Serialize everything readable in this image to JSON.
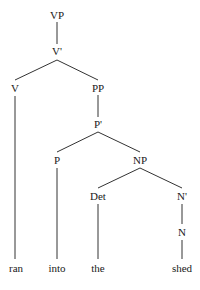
{
  "diagram": {
    "type": "syntax-tree",
    "phrase": "ran into the shed",
    "colors": {
      "text": "#1a1a1a",
      "edge": "#333333",
      "background": "#ffffff"
    },
    "nodes": [
      {
        "id": "vp",
        "label": "VP",
        "x": 57,
        "y": 15
      },
      {
        "id": "vbar",
        "label": "V'",
        "x": 57,
        "y": 51
      },
      {
        "id": "v",
        "label": "V",
        "x": 15,
        "y": 88
      },
      {
        "id": "pp",
        "label": "PP",
        "x": 98,
        "y": 88
      },
      {
        "id": "pbar",
        "label": "P'",
        "x": 98,
        "y": 124
      },
      {
        "id": "p",
        "label": "P",
        "x": 57,
        "y": 160
      },
      {
        "id": "np",
        "label": "NP",
        "x": 140,
        "y": 160
      },
      {
        "id": "det",
        "label": "Det",
        "x": 98,
        "y": 196
      },
      {
        "id": "nbar",
        "label": "N'",
        "x": 182,
        "y": 196
      },
      {
        "id": "n",
        "label": "N",
        "x": 182,
        "y": 232
      },
      {
        "id": "ran",
        "label": "ran",
        "x": 16,
        "y": 268
      },
      {
        "id": "into",
        "label": "into",
        "x": 57,
        "y": 268
      },
      {
        "id": "the",
        "label": "the",
        "x": 98,
        "y": 268
      },
      {
        "id": "shed",
        "label": "shed",
        "x": 182,
        "y": 268
      }
    ],
    "edges": [
      {
        "from": "vp",
        "to": "vbar",
        "x1": 57,
        "y1": 22,
        "x2": 57,
        "y2": 44
      },
      {
        "from": "vbar",
        "to": "v",
        "x1": 57,
        "y1": 60,
        "x2": 15,
        "y2": 80
      },
      {
        "from": "vbar",
        "to": "pp",
        "x1": 57,
        "y1": 60,
        "x2": 98,
        "y2": 80
      },
      {
        "from": "v",
        "to": "ran",
        "x1": 15,
        "y1": 96,
        "x2": 15,
        "y2": 259
      },
      {
        "from": "pp",
        "to": "pbar",
        "x1": 98,
        "y1": 95,
        "x2": 98,
        "y2": 117
      },
      {
        "from": "pbar",
        "to": "p",
        "x1": 98,
        "y1": 132,
        "x2": 57,
        "y2": 152
      },
      {
        "from": "pbar",
        "to": "np",
        "x1": 98,
        "y1": 132,
        "x2": 140,
        "y2": 152
      },
      {
        "from": "p",
        "to": "into",
        "x1": 57,
        "y1": 168,
        "x2": 57,
        "y2": 259
      },
      {
        "from": "np",
        "to": "det",
        "x1": 140,
        "y1": 168,
        "x2": 98,
        "y2": 188
      },
      {
        "from": "np",
        "to": "nbar",
        "x1": 140,
        "y1": 168,
        "x2": 182,
        "y2": 188
      },
      {
        "from": "det",
        "to": "the",
        "x1": 98,
        "y1": 204,
        "x2": 98,
        "y2": 259
      },
      {
        "from": "nbar",
        "to": "n",
        "x1": 182,
        "y1": 204,
        "x2": 182,
        "y2": 224
      },
      {
        "from": "n",
        "to": "shed",
        "x1": 182,
        "y1": 240,
        "x2": 182,
        "y2": 259
      }
    ]
  }
}
